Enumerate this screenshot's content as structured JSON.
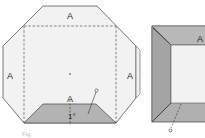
{
  "figure": {
    "left_diagram": {
      "face_labels": {
        "top": "A",
        "left": "A",
        "right": "A",
        "bottom": "A"
      },
      "angle_label": "1°",
      "pointer_label": "P",
      "caption": "Fig."
    },
    "right_diagram": {
      "face_label": "A",
      "pointer_label": "d"
    },
    "colors": {
      "face_fill": "#f2f2f2",
      "bevel_fill": "#b0b0b0",
      "bevel_dark": "#9e9e9e",
      "stroke": "#555555"
    }
  }
}
